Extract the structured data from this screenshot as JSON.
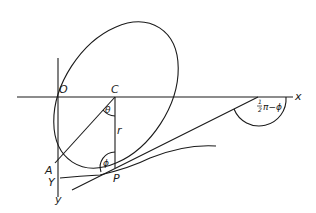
{
  "diagram": {
    "type": "geometry",
    "labels": {
      "origin": "O",
      "center": "C",
      "x_axis": "x",
      "y_axis": "y",
      "point_A": "A",
      "point_Y": "Y",
      "point_P": "P",
      "radius": "r",
      "angle_theta": "θ",
      "angle_phi": "ϕ",
      "angle_outer_frac_num": "1",
      "angle_outer_frac_den": "2",
      "angle_outer": "π−ϕ"
    },
    "colors": {
      "stroke": "#1a1a1a",
      "background": "#ffffff"
    }
  }
}
